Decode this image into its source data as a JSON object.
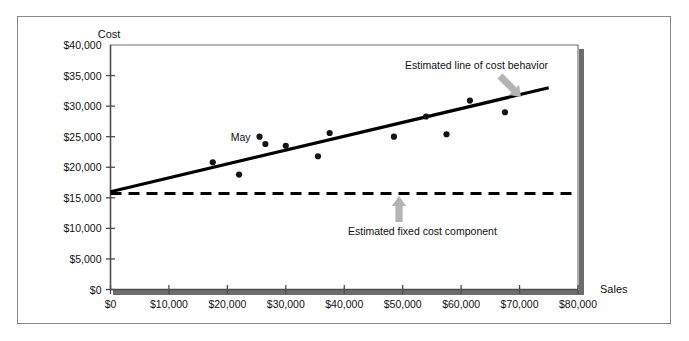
{
  "figure": {
    "frame_color": "#8a8a8a",
    "background": "#ffffff"
  },
  "chart_data": {
    "type": "scatter",
    "title": "",
    "xlabel": "Sales",
    "ylabel": "Cost",
    "xlim": [
      0,
      80000
    ],
    "ylim": [
      0,
      40000
    ],
    "grid": false,
    "legend": "none",
    "xticks": [
      0,
      10000,
      20000,
      30000,
      40000,
      50000,
      60000,
      70000,
      80000
    ],
    "xticklabels": [
      "$0",
      "$10,000",
      "$20,000",
      "$30,000",
      "$40,000",
      "$50,000",
      "$60,000",
      "$70,000",
      "$80,000"
    ],
    "yticks": [
      0,
      5000,
      10000,
      15000,
      20000,
      25000,
      30000,
      35000,
      40000
    ],
    "yticklabels": [
      "$0",
      "$5,000",
      "$10,000",
      "$15,000",
      "$20,000",
      "$25,000",
      "$30,000",
      "$35,000",
      "$40,000"
    ],
    "points": [
      {
        "x": 17500,
        "label": "",
        "y": 20800
      },
      {
        "x": 22000,
        "label": "",
        "y": 18800
      },
      {
        "x": 25500,
        "label": "May",
        "y": 25000
      },
      {
        "x": 26500,
        "label": "",
        "y": 23800
      },
      {
        "x": 30000,
        "label": "",
        "y": 23500
      },
      {
        "x": 35500,
        "label": "",
        "y": 21800
      },
      {
        "x": 37500,
        "label": "",
        "y": 25600
      },
      {
        "x": 48500,
        "label": "",
        "y": 25000
      },
      {
        "x": 54000,
        "label": "",
        "y": 28300
      },
      {
        "x": 57500,
        "label": "",
        "y": 25400
      },
      {
        "x": 61500,
        "label": "",
        "y": 30900
      },
      {
        "x": 67500,
        "label": "",
        "y": 29000
      }
    ],
    "series": [
      {
        "name": "Estimated line of cost behavior",
        "type": "line",
        "style": "solid",
        "color": "#000000",
        "x": [
          0,
          75000
        ],
        "values": [
          16000,
          33000
        ]
      },
      {
        "name": "Estimated fixed cost component",
        "type": "line",
        "style": "dashed",
        "color": "#000000",
        "x": [
          0,
          80000
        ],
        "values": [
          15700,
          15700
        ]
      }
    ],
    "annotations": [
      {
        "id": "cost-behavior-annotation",
        "text": "Estimated line of cost behavior",
        "text_x": 405,
        "text_y": 69,
        "arrow_from_x": 500,
        "arrow_from_y": 76,
        "arrow_to_x": 521,
        "arrow_to_y": 97,
        "arrow_color": "#b4b4b4"
      },
      {
        "id": "fixed-cost-annotation",
        "text": "Estimated fixed cost component",
        "text_x": 348,
        "text_y": 235,
        "arrow_from_x": 399,
        "arrow_from_y": 222,
        "arrow_to_x": 399,
        "arrow_to_y": 196,
        "arrow_color": "#b4b4b4"
      }
    ],
    "point_labels": [
      {
        "text": "May",
        "x": 25500,
        "y": 25000
      }
    ]
  }
}
